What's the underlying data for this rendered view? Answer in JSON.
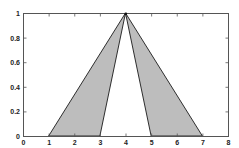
{
  "chart_data": {
    "type": "area",
    "title": "",
    "xlabel": "",
    "ylabel": "",
    "xlim": [
      0,
      8
    ],
    "ylim": [
      0,
      1
    ],
    "grid": false,
    "legend": null,
    "x_ticks": [
      0,
      1,
      2,
      3,
      4,
      5,
      6,
      7,
      8
    ],
    "x_tick_labels": [
      "0",
      "1",
      "2",
      "3",
      "4",
      "5",
      "6",
      "7",
      "8"
    ],
    "y_ticks": [
      0,
      0.2,
      0.4,
      0.6,
      0.8,
      1
    ],
    "y_tick_labels": [
      "0",
      "0.2",
      "0.4",
      "0.6",
      "0.8",
      "1"
    ],
    "series": [
      {
        "name": "left-triangle",
        "shape": "filled-polygon",
        "points": [
          [
            1,
            0
          ],
          [
            4,
            1
          ],
          [
            3,
            0
          ]
        ],
        "fill": "#bdbdbd",
        "stroke": "#1a1a1a"
      },
      {
        "name": "right-triangle",
        "shape": "filled-polygon",
        "points": [
          [
            5,
            0
          ],
          [
            4,
            1
          ],
          [
            7,
            0
          ]
        ],
        "fill": "#bdbdbd",
        "stroke": "#1a1a1a"
      }
    ],
    "annotations": [
      {
        "type": "vertex-marker",
        "x": 4,
        "y": 1
      }
    ]
  },
  "plot_area": {
    "left": 23,
    "right": 228,
    "top": 13,
    "bottom": 136
  },
  "colors": {
    "axis": "#555555",
    "fill": "#bdbdbd",
    "stroke": "#1a1a1a",
    "background": "#ffffff"
  }
}
